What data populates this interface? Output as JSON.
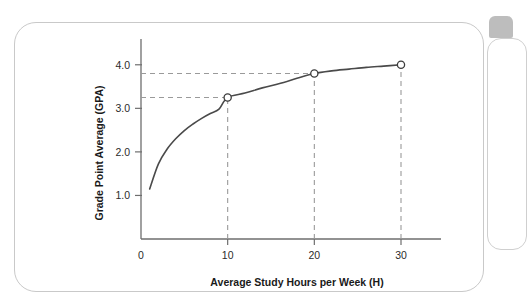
{
  "figure": {
    "panel_name": "chart-figure-panel"
  },
  "chart_data": {
    "type": "line",
    "title": "",
    "xlabel": "Average Study Hours per Week (H)",
    "ylabel": "Grade Point Average (GPA)",
    "xlim": [
      0,
      33
    ],
    "ylim": [
      0,
      4.5
    ],
    "grid": false,
    "legend": null,
    "x_ticks": [
      0,
      10,
      20,
      30
    ],
    "x_tick_labels": [
      "0",
      "10",
      "20",
      "30"
    ],
    "y_ticks": [
      1.0,
      2.0,
      3.0,
      4.0
    ],
    "y_tick_labels": [
      "1.0",
      "2.0",
      "3.0",
      "4.0"
    ],
    "curve_description": "concave increasing logarithmic curve",
    "x": [
      1,
      2,
      3,
      4,
      5,
      6,
      7,
      8,
      9,
      10,
      12,
      14,
      16,
      18,
      20,
      22,
      24,
      26,
      28,
      30
    ],
    "y": [
      1.15,
      1.72,
      2.06,
      2.3,
      2.49,
      2.64,
      2.77,
      2.88,
      2.98,
      3.25,
      3.35,
      3.47,
      3.57,
      3.69,
      3.8,
      3.86,
      3.9,
      3.94,
      3.97,
      4.0
    ],
    "markers": [
      {
        "x": 10,
        "y": 3.25,
        "label": "",
        "style": "open-circle"
      },
      {
        "x": 20,
        "y": 3.8,
        "label": "",
        "style": "open-circle"
      },
      {
        "x": 30,
        "y": 4.0,
        "label": "",
        "style": "open-circle"
      }
    ],
    "guide_lines": [
      {
        "type": "horizontal",
        "value": 3.25,
        "from_x": 0,
        "to_x": 10
      },
      {
        "type": "horizontal",
        "value": 3.8,
        "from_x": 0,
        "to_x": 20
      },
      {
        "type": "vertical",
        "value": 10,
        "from_y": 0,
        "to_y": 3.25
      },
      {
        "type": "vertical",
        "value": 20,
        "from_y": 0,
        "to_y": 3.8
      },
      {
        "type": "vertical",
        "value": 30,
        "from_y": 0,
        "to_y": 4.0
      }
    ],
    "colors": {
      "curve": "#4a4a4a",
      "axis": "#6e6e6e",
      "guide": "#9a9a9a",
      "marker_fill": "#ffffff",
      "marker_stroke": "#3c3c3c",
      "background": "#ffffff"
    }
  }
}
